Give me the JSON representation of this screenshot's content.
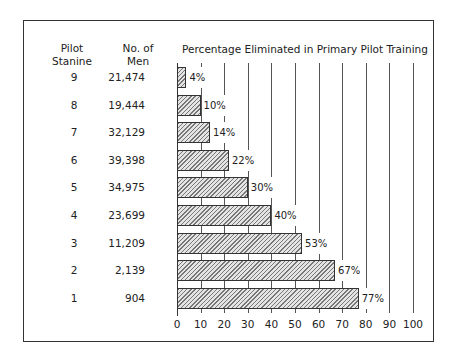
{
  "headers": {
    "stanine_line1": "Pilot",
    "stanine_line2": "Stanine",
    "men_line1": "No. of",
    "men_line2": "Men",
    "title": "Percentage Eliminated in Primary Pilot Training"
  },
  "rows": [
    {
      "stanine": "9",
      "men": "21,474",
      "pct": 4,
      "label": "4%"
    },
    {
      "stanine": "8",
      "men": "19,444",
      "pct": 10,
      "label": "10%"
    },
    {
      "stanine": "7",
      "men": "32,129",
      "pct": 14,
      "label": "14%"
    },
    {
      "stanine": "6",
      "men": "39,398",
      "pct": 22,
      "label": "22%"
    },
    {
      "stanine": "5",
      "men": "34,975",
      "pct": 30,
      "label": "30%"
    },
    {
      "stanine": "4",
      "men": "23,699",
      "pct": 40,
      "label": "40%"
    },
    {
      "stanine": "3",
      "men": "11,209",
      "pct": 53,
      "label": "53%"
    },
    {
      "stanine": "2",
      "men": "2,139",
      "pct": 67,
      "label": "67%"
    },
    {
      "stanine": "1",
      "men": "904",
      "pct": 77,
      "label": "77%"
    }
  ],
  "axis": {
    "ticks": [
      "0",
      "10",
      "20",
      "30",
      "40",
      "50",
      "60",
      "70",
      "80",
      "90",
      "100"
    ]
  },
  "chart_data": {
    "type": "bar",
    "orientation": "horizontal",
    "title": "Percentage Eliminated in Primary Pilot Training",
    "categories": [
      "9",
      "8",
      "7",
      "6",
      "5",
      "4",
      "3",
      "2",
      "1"
    ],
    "category_label": "Pilot Stanine",
    "values": [
      4,
      10,
      14,
      22,
      30,
      40,
      53,
      67,
      77
    ],
    "value_labels": [
      "4%",
      "10%",
      "14%",
      "22%",
      "30%",
      "40%",
      "53%",
      "67%",
      "77%"
    ],
    "side_table": {
      "header": "No. of Men",
      "values": [
        21474,
        19444,
        32129,
        39398,
        34975,
        23699,
        11209,
        2139,
        904
      ]
    },
    "xlabel": "",
    "ylabel": "Pilot Stanine",
    "xlim": [
      0,
      100
    ],
    "xticks": [
      0,
      10,
      20,
      30,
      40,
      50,
      60,
      70,
      80,
      90,
      100
    ],
    "grid": true,
    "legend": null
  }
}
